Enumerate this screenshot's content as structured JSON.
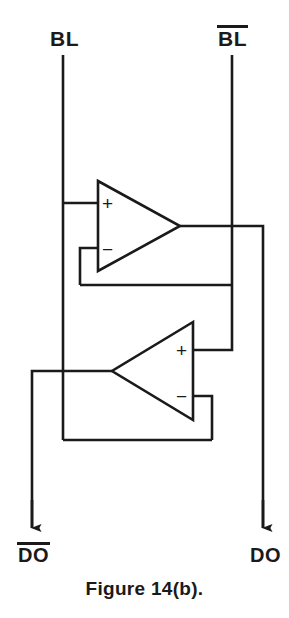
{
  "figure": {
    "caption": "Figure 14(b).",
    "title": "Figure 14(b).",
    "ink_color": "#1a1a1a",
    "background_color": "#ffffff"
  },
  "labels": {
    "bit_line": "BL",
    "bit_line_bar": "BL",
    "bit_line_bar_has_overbar": true,
    "data_out": "DO",
    "data_out_bar": "DO",
    "data_out_bar_has_overbar": true
  },
  "amplifiers": [
    {
      "name": "upper-amplifier",
      "orientation": "points-right",
      "plus_label": "+",
      "minus_label": "−",
      "plus_input": "BL",
      "minus_input": "feedback-from-lower-output",
      "output": "DO"
    },
    {
      "name": "lower-amplifier",
      "orientation": "points-left",
      "plus_label": "+",
      "minus_label": "−",
      "plus_input": "BL-bar",
      "minus_input": "feedback-from-upper-output",
      "output": "DO-bar"
    }
  ],
  "signals": {
    "inputs": [
      "BL",
      "BL"
    ],
    "outputs": [
      "DO",
      "DO"
    ]
  }
}
